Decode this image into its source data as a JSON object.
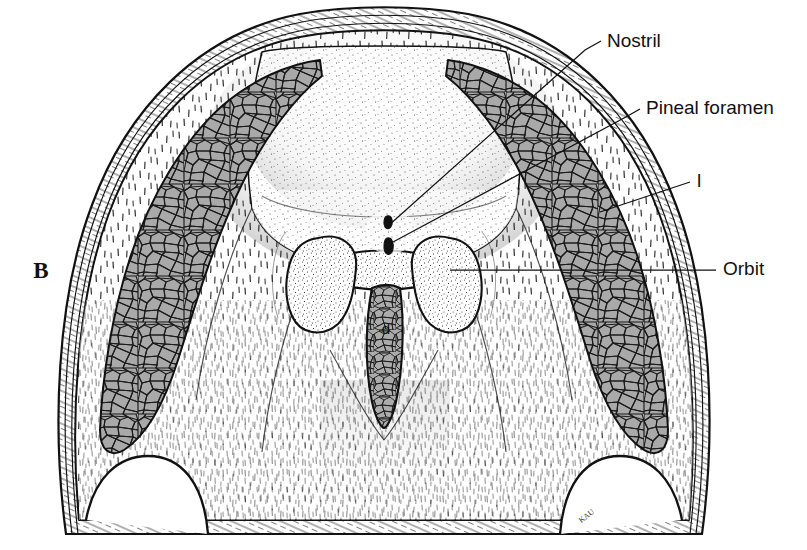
{
  "figure": {
    "panel_letter": "B",
    "signature": "KAU",
    "background_color": "#ffffff",
    "ink_color": "#111111",
    "mosaic_fill_color": "#a9a9a9",
    "mosaic_line_color": "#1a1a1a",
    "bone_fill_color": "#ffffff"
  },
  "labels": [
    {
      "id": "nostril",
      "text": "Nostril",
      "x": 607,
      "y": 47,
      "anchor": "start"
    },
    {
      "id": "pineal-foramen",
      "text": "Pineal foramen",
      "x": 646,
      "y": 114,
      "anchor": "start"
    },
    {
      "id": "lateral-line",
      "text": "l",
      "x": 697,
      "y": 187,
      "anchor": "start"
    },
    {
      "id": "orbit",
      "text": "Orbit",
      "x": 723,
      "y": 275,
      "anchor": "start"
    }
  ],
  "leaders": [
    {
      "id": "leader-nostril",
      "points": "601,41 585,50 388,226"
    },
    {
      "id": "leader-pineal-foramen",
      "points": "640,109 624,118 393,242"
    },
    {
      "id": "leader-lateral-line",
      "points": "690,182 600,212"
    },
    {
      "id": "leader-orbit",
      "points": "716,270 450,270"
    }
  ],
  "internal_marks": [
    {
      "id": "dermal-element-d",
      "text": "d",
      "x": 386,
      "y": 334
    },
    {
      "id": "panel-letter-b",
      "text": "B",
      "x": 41,
      "y": 278
    },
    {
      "id": "artist-signature",
      "text": "KAU",
      "x": 588,
      "y": 518
    }
  ],
  "anatomy": {
    "structures": [
      "skull roof outline",
      "outer rim bands",
      "left mosaic band",
      "right mosaic band",
      "left orbit",
      "right orbit",
      "nostril opening",
      "pineal foramen",
      "median dermal element",
      "left posterior notch",
      "right posterior notch"
    ]
  }
}
